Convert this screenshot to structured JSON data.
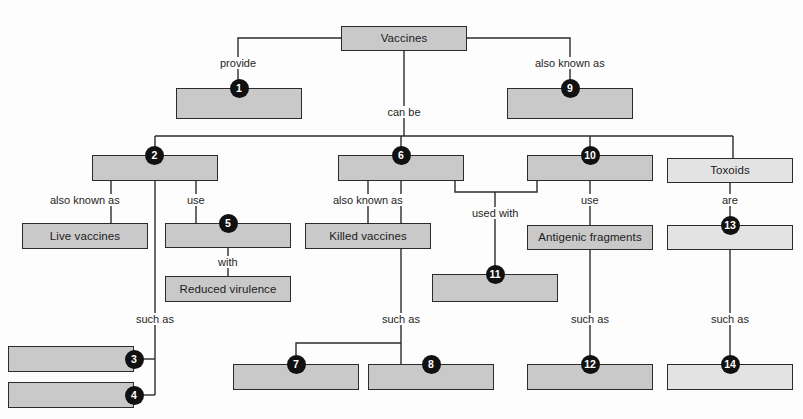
{
  "diagram": {
    "root": {
      "id": "root",
      "label": "Vaccines"
    },
    "colors": {
      "box_fill_dark": "#c9c9c9",
      "box_fill_light": "#e3e3e3",
      "box_border": "#2b2b2b",
      "badge_fill": "#111111",
      "badge_text": "#ffffff",
      "line": "#2b2b2b",
      "background": "#fdfdfd",
      "text": "#1c1c1c"
    },
    "nodes": [
      {
        "key": "root",
        "label": "Vaccines",
        "number": "",
        "fill": "dark",
        "x": 341,
        "y": 26,
        "w": 126,
        "h": 25,
        "badge": "none"
      },
      {
        "key": "n1",
        "label": "",
        "number": "1",
        "fill": "dark",
        "x": 176,
        "y": 88,
        "w": 126,
        "h": 31,
        "badge": "top"
      },
      {
        "key": "n9",
        "label": "",
        "number": "9",
        "fill": "dark",
        "x": 507,
        "y": 88,
        "w": 126,
        "h": 31,
        "badge": "top"
      },
      {
        "key": "n2",
        "label": "",
        "number": "2",
        "fill": "dark",
        "x": 92,
        "y": 155,
        "w": 126,
        "h": 26,
        "badge": "top-left"
      },
      {
        "key": "n6",
        "label": "",
        "number": "6",
        "fill": "dark",
        "x": 338,
        "y": 155,
        "w": 126,
        "h": 26,
        "badge": "top"
      },
      {
        "key": "n10",
        "label": "",
        "number": "10",
        "fill": "dark",
        "x": 527,
        "y": 155,
        "w": 126,
        "h": 26,
        "badge": "top"
      },
      {
        "key": "toxoids",
        "label": "Toxoids",
        "number": "",
        "fill": "light",
        "x": 667,
        "y": 158,
        "w": 126,
        "h": 25,
        "badge": "none"
      },
      {
        "key": "live",
        "label": "Live vaccines",
        "number": "",
        "fill": "dark",
        "x": 22,
        "y": 223,
        "w": 126,
        "h": 26,
        "badge": "none"
      },
      {
        "key": "n5",
        "label": "",
        "number": "5",
        "fill": "dark",
        "x": 165,
        "y": 223,
        "w": 126,
        "h": 25,
        "badge": "top"
      },
      {
        "key": "killed",
        "label": "Killed vaccines",
        "number": "",
        "fill": "dark",
        "x": 305,
        "y": 223,
        "w": 126,
        "h": 26,
        "badge": "none"
      },
      {
        "key": "antigenic",
        "label": "Antigenic fragments",
        "number": "",
        "fill": "dark",
        "x": 527,
        "y": 225,
        "w": 126,
        "h": 25,
        "badge": "none"
      },
      {
        "key": "n13",
        "label": "",
        "number": "13",
        "fill": "light",
        "x": 667,
        "y": 225,
        "w": 126,
        "h": 25,
        "badge": "top"
      },
      {
        "key": "reduced",
        "label": "Reduced virulence",
        "number": "",
        "fill": "dark",
        "x": 165,
        "y": 276,
        "w": 126,
        "h": 26,
        "badge": "none"
      },
      {
        "key": "n11",
        "label": "",
        "number": "11",
        "fill": "dark",
        "x": 432,
        "y": 274,
        "w": 126,
        "h": 28,
        "badge": "top"
      },
      {
        "key": "n3",
        "label": "",
        "number": "3",
        "fill": "dark",
        "x": 8,
        "y": 346,
        "w": 126,
        "h": 26,
        "badge": "right"
      },
      {
        "key": "n4",
        "label": "",
        "number": "4",
        "fill": "dark",
        "x": 8,
        "y": 382,
        "w": 126,
        "h": 26,
        "badge": "right"
      },
      {
        "key": "n7",
        "label": "",
        "number": "7",
        "fill": "dark",
        "x": 233,
        "y": 364,
        "w": 126,
        "h": 26,
        "badge": "top"
      },
      {
        "key": "n8",
        "label": "",
        "number": "8",
        "fill": "dark",
        "x": 368,
        "y": 364,
        "w": 126,
        "h": 26,
        "badge": "top"
      },
      {
        "key": "n12",
        "label": "",
        "number": "12",
        "fill": "dark",
        "x": 527,
        "y": 364,
        "w": 126,
        "h": 26,
        "badge": "top"
      },
      {
        "key": "n14",
        "label": "",
        "number": "14",
        "fill": "light",
        "x": 667,
        "y": 364,
        "w": 126,
        "h": 26,
        "badge": "top"
      }
    ],
    "link_labels": [
      {
        "key": "l_provide",
        "text": "provide",
        "x": 238,
        "y": 64,
        "anchor": "middle"
      },
      {
        "key": "l_akas_top",
        "text": "also known as",
        "x": 570,
        "y": 64,
        "anchor": "middle"
      },
      {
        "key": "l_canbe",
        "text": "can be",
        "x": 404,
        "y": 113,
        "anchor": "middle"
      },
      {
        "key": "l_aka_2",
        "text": "also known as",
        "x": 85,
        "y": 201,
        "anchor": "middle"
      },
      {
        "key": "l_use_2",
        "text": "use",
        "x": 196,
        "y": 201,
        "anchor": "middle"
      },
      {
        "key": "l_aka_6",
        "text": "also known as",
        "x": 368,
        "y": 201,
        "anchor": "middle"
      },
      {
        "key": "l_usedwith",
        "text": "used with",
        "x": 495,
        "y": 214,
        "anchor": "middle"
      },
      {
        "key": "l_use_10",
        "text": "use",
        "x": 590,
        "y": 201,
        "anchor": "middle"
      },
      {
        "key": "l_are",
        "text": "are",
        "x": 730,
        "y": 201,
        "anchor": "middle"
      },
      {
        "key": "l_with",
        "text": "with",
        "x": 228,
        "y": 263,
        "anchor": "middle"
      },
      {
        "key": "l_suchas_2",
        "text": "such as",
        "x": 155,
        "y": 320,
        "anchor": "middle"
      },
      {
        "key": "l_suchas_6",
        "text": "such as",
        "x": 401,
        "y": 320,
        "anchor": "middle"
      },
      {
        "key": "l_suchas_10",
        "text": "such as",
        "x": 590,
        "y": 320,
        "anchor": "middle"
      },
      {
        "key": "l_suchas_13",
        "text": "such as",
        "x": 730,
        "y": 320,
        "anchor": "middle"
      }
    ],
    "edges": [
      {
        "key": "e_root_provide",
        "from": "root",
        "to": "n1",
        "label": "provide",
        "d": "M 341 38 L 238 38 L 238 88"
      },
      {
        "key": "e_root_aka",
        "from": "root",
        "to": "n9",
        "label": "also known as",
        "d": "M 467 38 L 570 38 L 570 88"
      },
      {
        "key": "e_root_canbe",
        "from": "root",
        "to": "bus",
        "label": "can be",
        "d": "M 404 51 L 404 136"
      },
      {
        "key": "e_bus",
        "from": "bus",
        "to": "bus",
        "label": "",
        "d": "M 155 136 L 733 136"
      },
      {
        "key": "e_bus_n2",
        "from": "bus",
        "to": "n2",
        "label": "",
        "d": "M 155 136 L 155 155"
      },
      {
        "key": "e_bus_n6",
        "from": "bus",
        "to": "n6",
        "label": "",
        "d": "M 401 136 L 401 155"
      },
      {
        "key": "e_bus_n10",
        "from": "bus",
        "to": "n10",
        "label": "",
        "d": "M 590 136 L 590 155"
      },
      {
        "key": "e_bus_tox",
        "from": "bus",
        "to": "toxoids",
        "label": "",
        "d": "M 733 136 L 733 158"
      },
      {
        "key": "e_n2_live",
        "from": "n2",
        "to": "live",
        "label": "also known as",
        "d": "M 111 181 L 111 223"
      },
      {
        "key": "e_n2_n5",
        "from": "n2",
        "to": "n5",
        "label": "use",
        "d": "M 196 181 L 196 223"
      },
      {
        "key": "e_n2_suchas",
        "from": "n2",
        "to": "n3n4",
        "label": "such as",
        "d": "M 155 181 L 155 395"
      },
      {
        "key": "e_n5_reduced",
        "from": "n5",
        "to": "reduced",
        "label": "with",
        "d": "M 228 248 L 228 276"
      },
      {
        "key": "e_n3",
        "from": "stem",
        "to": "n3",
        "label": "",
        "d": "M 155 359 L 134 359"
      },
      {
        "key": "e_n4",
        "from": "stem",
        "to": "n4",
        "label": "",
        "d": "M 155 395 L 134 395"
      },
      {
        "key": "e_n6_killed",
        "from": "n6",
        "to": "killed",
        "label": "also known as",
        "d": "M 368 181 L 368 223"
      },
      {
        "key": "e_n6_suchas",
        "from": "n6",
        "to": "n7n8",
        "label": "such as",
        "d": "M 401 181 L 401 364"
      },
      {
        "key": "e_n6_used",
        "from": "n6",
        "to": "join",
        "label": "",
        "d": "M 455 181 L 455 192 L 495 192"
      },
      {
        "key": "e_n10_used",
        "from": "n10",
        "to": "join",
        "label": "",
        "d": "M 537 181 L 537 192 L 495 192"
      },
      {
        "key": "e_join_n11",
        "from": "join",
        "to": "n11",
        "label": "used with",
        "d": "M 495 192 L 495 274"
      },
      {
        "key": "e_n10_ant",
        "from": "n10",
        "to": "antigenic",
        "label": "use",
        "d": "M 590 181 L 590 225"
      },
      {
        "key": "e_n10_suchas",
        "from": "n10",
        "to": "n12",
        "label": "such as",
        "d": "M 590 250 L 590 364"
      },
      {
        "key": "e_tox_n13",
        "from": "toxoids",
        "to": "n13",
        "label": "are",
        "d": "M 730 183 L 730 225"
      },
      {
        "key": "e_n13_suchas",
        "from": "n13",
        "to": "n14",
        "label": "such as",
        "d": "M 730 250 L 730 364"
      },
      {
        "key": "e_n7_n8",
        "from": "stem",
        "to": "n7",
        "label": "",
        "d": "M 296 377 L 296 343 L 401 343"
      }
    ]
  }
}
